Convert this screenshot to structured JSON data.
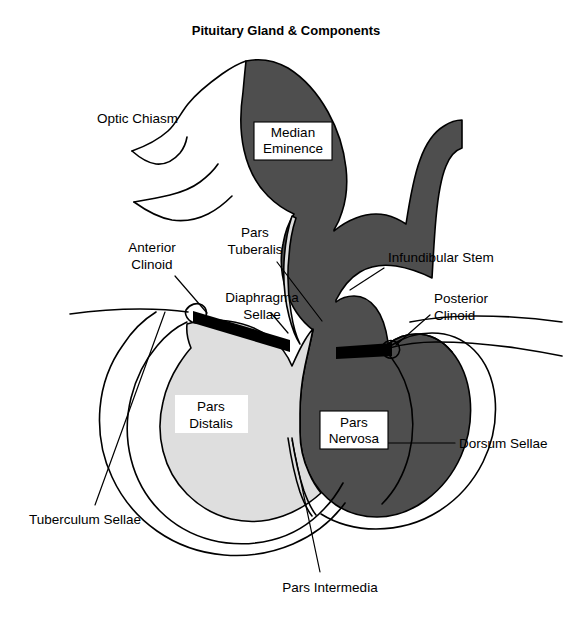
{
  "figure": {
    "title": "Pituitary Gland & Components",
    "width": 572,
    "height": 634,
    "background": "#ffffff"
  },
  "colors": {
    "background": "#ffffff",
    "outline": "#000000",
    "dark_region": "#4e4e4e",
    "light_region": "#dedede",
    "band": "#000000",
    "label_box_fill": "#ffffff",
    "text": "#000000"
  },
  "regions": [
    {
      "name": "median-eminence-hypothalamus",
      "label": "Median Eminence",
      "fill": "#4e4e4e",
      "boxed": true,
      "box_border": true
    },
    {
      "name": "pars-nervosa",
      "label": "Pars Nervosa",
      "fill": "#4e4e4e",
      "boxed": true,
      "box_border": true
    },
    {
      "name": "pars-distalis",
      "label": "Pars Distalis",
      "fill": "#dedede",
      "boxed": true,
      "box_border": false
    },
    {
      "name": "diaphragma-sellae-band",
      "label": "Diaphragma Sellae",
      "fill": "#000000",
      "boxed": false,
      "box_border": false
    }
  ],
  "labels": {
    "optic_chiasm": "Optic Chiasm",
    "median_eminence_line1": "Median",
    "median_eminence_line2": "Eminence",
    "pars_tuberalis_line1": "Pars",
    "pars_tuberalis_line2": "Tuberalis",
    "anterior_clinoid_line1": "Anterior",
    "anterior_clinoid_line2": "Clinoid",
    "diaphragma_sellae_line1": "Diaphragma",
    "diaphragma_sellae_line2": "Sellae",
    "infundibular_stem": "Infundibular Stem",
    "posterior_clinoid_line1": "Posterior",
    "posterior_clinoid_line2": "Clinoid",
    "pars_distalis_line1": "Pars",
    "pars_distalis_line2": "Distalis",
    "pars_nervosa_line1": "Pars",
    "pars_nervosa_line2": "Nervosa",
    "dorsum_sellae": "Dorsum Sellae",
    "tuberculum_sellae": "Tuberculum Sellae",
    "pars_intermedia": "Pars Intermedia"
  },
  "annotations": [
    {
      "name": "optic-chiasm",
      "text": "Optic Chiasm",
      "has_leader": false,
      "anchor": "start"
    },
    {
      "name": "median-eminence",
      "text": "Median Eminence",
      "has_leader": false,
      "anchor": "middle",
      "boxed": true
    },
    {
      "name": "pars-tuberalis",
      "text": "Pars Tuberalis",
      "has_leader": true,
      "anchor": "middle"
    },
    {
      "name": "anterior-clinoid",
      "text": "Anterior Clinoid",
      "has_leader": true,
      "anchor": "middle"
    },
    {
      "name": "diaphragma-sellae",
      "text": "Diaphragma Sellae",
      "has_leader": true,
      "anchor": "middle"
    },
    {
      "name": "infundibular-stem",
      "text": "Infundibular Stem",
      "has_leader": true,
      "anchor": "start"
    },
    {
      "name": "posterior-clinoid",
      "text": "Posterior Clinoid",
      "has_leader": true,
      "anchor": "start"
    },
    {
      "name": "pars-distalis",
      "text": "Pars Distalis",
      "has_leader": false,
      "anchor": "middle",
      "boxed": true
    },
    {
      "name": "pars-nervosa",
      "text": "Pars Nervosa",
      "has_leader": true,
      "anchor": "middle",
      "boxed": true
    },
    {
      "name": "dorsum-sellae",
      "text": "Dorsum Sellae",
      "has_leader": true,
      "anchor": "start"
    },
    {
      "name": "tuberculum-sellae",
      "text": "Tuberculum Sellae",
      "has_leader": true,
      "anchor": "middle"
    },
    {
      "name": "pars-intermedia",
      "text": "Pars Intermedia",
      "has_leader": true,
      "anchor": "middle"
    }
  ]
}
